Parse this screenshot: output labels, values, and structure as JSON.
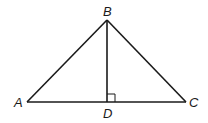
{
  "diagram": {
    "type": "triangle-with-altitude",
    "labels": {
      "A": "A",
      "B": "B",
      "C": "C",
      "D": "D"
    },
    "segments": [
      "AB",
      "BC",
      "AC",
      "BD"
    ],
    "right_angle_at": "D",
    "colors": {
      "stroke": "#1a1a1a",
      "background": "#ffffff"
    }
  }
}
